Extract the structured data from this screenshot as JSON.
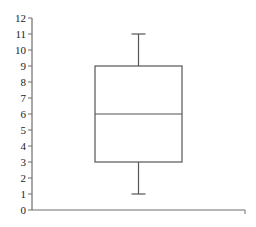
{
  "chart_data": {
    "type": "boxplot",
    "title": "",
    "xlabel": "",
    "ylabel": "",
    "ylim": [
      0,
      12
    ],
    "yticks": [
      0,
      1,
      2,
      3,
      4,
      5,
      6,
      7,
      8,
      9,
      10,
      11,
      12
    ],
    "grid": false,
    "legend": null,
    "series": [
      {
        "name": "",
        "min": 1,
        "q1": 3,
        "median": 6,
        "q3": 9,
        "max": 11
      }
    ]
  },
  "colors": {
    "axis": "#6e6e6e",
    "box": "#555555",
    "text": "#222222",
    "background": "#ffffff"
  }
}
